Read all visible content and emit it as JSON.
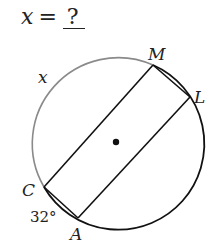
{
  "prompt": {
    "variable": "x",
    "equals": "=",
    "answer": "?"
  },
  "diagram": {
    "type": "circle with parallel chords",
    "center": {
      "x": 116,
      "y": 142
    },
    "radius": 86,
    "points": {
      "M": {
        "label": "M",
        "x": 153,
        "y": 65
      },
      "L": {
        "label": "L",
        "x": 190,
        "y": 97
      },
      "C": {
        "label": "C",
        "x": 44,
        "y": 187
      },
      "A": {
        "label": "A",
        "x": 78,
        "y": 218
      }
    },
    "chords": [
      [
        "M",
        "C"
      ],
      [
        "L",
        "A"
      ],
      [
        "M",
        "L"
      ],
      [
        "C",
        "A"
      ]
    ],
    "arc_labels": {
      "x_arc": "x",
      "ca_arc": "32°"
    },
    "colors": {
      "x_arc": "#8a8a8a",
      "main": "#111111"
    }
  }
}
